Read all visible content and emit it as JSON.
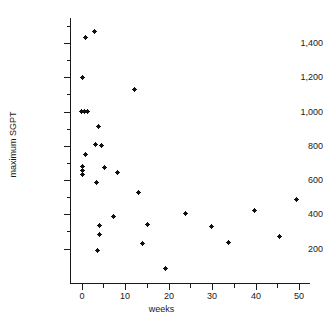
{
  "chart_data": {
    "type": "scatter",
    "title": "",
    "xlabel": "weeks",
    "ylabel": "maximum SGPT",
    "xlim": [
      -3,
      52
    ],
    "ylim": [
      60,
      1500
    ],
    "grid": false,
    "legend": "none",
    "x_ticks": [
      0,
      10,
      20,
      30,
      40,
      50
    ],
    "x_tick_labels": [
      "0",
      "10",
      "20",
      "30",
      "40",
      "50"
    ],
    "x_minor_ticks": [
      5,
      15,
      25,
      35,
      45
    ],
    "y_ticks": [
      200,
      400,
      600,
      800,
      1000,
      1200,
      1400
    ],
    "y_tick_labels": [
      "200",
      "400",
      "600",
      "800",
      "1,000",
      "1,200",
      "1,400"
    ],
    "y_minor_ticks": [
      300,
      500,
      700,
      900,
      1100,
      1300,
      1500
    ],
    "marker": "square-cross",
    "marker_color": "#111111",
    "points": [
      {
        "x": 1.0,
        "y": 1430
      },
      {
        "x": 3.0,
        "y": 1465
      },
      {
        "x": 0.2,
        "y": 1200
      },
      {
        "x": 0.0,
        "y": 1000
      },
      {
        "x": 0.7,
        "y": 1000
      },
      {
        "x": 1.4,
        "y": 1000
      },
      {
        "x": 3.9,
        "y": 910
      },
      {
        "x": 3.3,
        "y": 805
      },
      {
        "x": 4.5,
        "y": 800
      },
      {
        "x": 1.0,
        "y": 752
      },
      {
        "x": 0.3,
        "y": 680
      },
      {
        "x": 0.3,
        "y": 655
      },
      {
        "x": 0.3,
        "y": 630
      },
      {
        "x": 5.2,
        "y": 672
      },
      {
        "x": 8.3,
        "y": 645
      },
      {
        "x": 3.5,
        "y": 587
      },
      {
        "x": 12.2,
        "y": 1128
      },
      {
        "x": 13.0,
        "y": 528
      },
      {
        "x": 7.4,
        "y": 385
      },
      {
        "x": 4.2,
        "y": 337
      },
      {
        "x": 4.2,
        "y": 283
      },
      {
        "x": 3.6,
        "y": 190
      },
      {
        "x": 15.2,
        "y": 340
      },
      {
        "x": 14.0,
        "y": 230
      },
      {
        "x": 19.3,
        "y": 85
      },
      {
        "x": 24.0,
        "y": 405
      },
      {
        "x": 29.8,
        "y": 331
      },
      {
        "x": 33.7,
        "y": 234
      },
      {
        "x": 39.8,
        "y": 421
      },
      {
        "x": 45.6,
        "y": 273
      },
      {
        "x": 49.5,
        "y": 487
      }
    ]
  }
}
